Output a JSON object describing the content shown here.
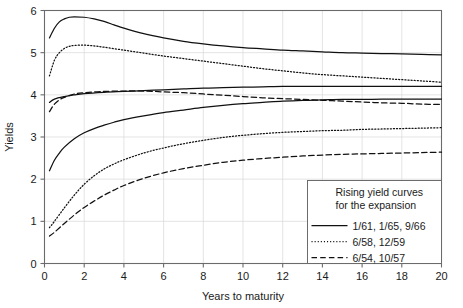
{
  "chart_data": {
    "type": "line",
    "title": "",
    "xlabel": "Years to maturity",
    "ylabel": "Yields",
    "xlim": [
      0,
      20
    ],
    "ylim": [
      0,
      6
    ],
    "xticks": [
      "0",
      "2",
      "4",
      "6",
      "8",
      "10",
      "12",
      "14",
      "16",
      "18",
      "20"
    ],
    "yticks": [
      "0",
      "1",
      "2",
      "3",
      "4",
      "5",
      "6"
    ],
    "grid": true,
    "legend_position": "bottom-right",
    "legend_title": [
      "Rising yield curves",
      "for the expansion"
    ],
    "series": [
      {
        "name": "1/61, 1/65, 9/66",
        "style": "solid",
        "band": "upper",
        "x": [
          0.25,
          0.5,
          0.75,
          1.0,
          1.25,
          1.5,
          2.0,
          2.5,
          3.0,
          3.5,
          4.0,
          5.0,
          6.0,
          7.0,
          8.0,
          9.0,
          10.0,
          11.0,
          12.0,
          13.0,
          14.0,
          15.0,
          16.0,
          17.0,
          18.0,
          19.0,
          20.0
        ],
        "y": [
          5.35,
          5.58,
          5.73,
          5.8,
          5.84,
          5.85,
          5.84,
          5.8,
          5.74,
          5.66,
          5.58,
          5.45,
          5.35,
          5.27,
          5.21,
          5.16,
          5.12,
          5.09,
          5.06,
          5.04,
          5.02,
          5.0,
          4.99,
          4.98,
          4.97,
          4.96,
          4.95
        ]
      },
      {
        "name": "1/61, 1/65, 9/66",
        "style": "solid",
        "band": "middle-upper",
        "x": [
          0.25,
          0.5,
          1.0,
          1.5,
          2.0,
          3.0,
          4.0,
          5.0,
          6.0,
          7.0,
          8.0,
          9.0,
          10.0,
          11.0,
          12.0,
          13.0,
          14.0,
          15.0,
          16.0,
          17.0,
          18.0,
          19.0,
          20.0
        ],
        "y": [
          3.82,
          3.9,
          3.96,
          4.0,
          4.03,
          4.06,
          4.08,
          4.1,
          4.12,
          4.14,
          4.16,
          4.17,
          4.18,
          4.19,
          4.2,
          4.2,
          4.2,
          4.2,
          4.2,
          4.2,
          4.2,
          4.2,
          4.2
        ]
      },
      {
        "name": "1/61, 1/65, 9/66",
        "style": "solid",
        "band": "lower",
        "x": [
          0.25,
          0.5,
          0.75,
          1.0,
          1.5,
          2.0,
          2.5,
          3.0,
          3.5,
          4.0,
          5.0,
          6.0,
          7.0,
          8.0,
          9.0,
          10.0,
          11.0,
          12.0,
          13.0,
          14.0,
          15.0,
          16.0,
          17.0,
          18.0,
          19.0,
          20.0
        ],
        "y": [
          2.2,
          2.45,
          2.62,
          2.76,
          2.96,
          3.1,
          3.2,
          3.28,
          3.35,
          3.41,
          3.5,
          3.58,
          3.64,
          3.7,
          3.75,
          3.79,
          3.82,
          3.85,
          3.87,
          3.88,
          3.89,
          3.89,
          3.9,
          3.9,
          3.9,
          3.9
        ]
      },
      {
        "name": "6/58, 12/59",
        "style": "dotted",
        "band": "upper",
        "x": [
          0.25,
          0.5,
          0.75,
          1.0,
          1.25,
          1.5,
          2.0,
          2.5,
          3.0,
          4.0,
          5.0,
          6.0,
          7.0,
          8.0,
          9.0,
          10.0,
          11.0,
          12.0,
          13.0,
          14.0,
          15.0,
          16.0,
          17.0,
          18.0,
          19.0,
          20.0
        ],
        "y": [
          4.45,
          4.82,
          5.0,
          5.1,
          5.15,
          5.17,
          5.18,
          5.16,
          5.13,
          5.06,
          4.99,
          4.92,
          4.86,
          4.8,
          4.74,
          4.68,
          4.62,
          4.57,
          4.52,
          4.48,
          4.45,
          4.42,
          4.39,
          4.36,
          4.33,
          4.3
        ]
      },
      {
        "name": "6/58, 12/59",
        "style": "dotted",
        "band": "lower",
        "x": [
          0.25,
          0.5,
          1.0,
          1.5,
          2.0,
          2.5,
          3.0,
          3.5,
          4.0,
          5.0,
          6.0,
          7.0,
          8.0,
          9.0,
          10.0,
          11.0,
          12.0,
          13.0,
          14.0,
          15.0,
          16.0,
          17.0,
          18.0,
          19.0,
          20.0
        ],
        "y": [
          0.85,
          1.0,
          1.32,
          1.62,
          1.88,
          2.08,
          2.24,
          2.36,
          2.46,
          2.62,
          2.74,
          2.84,
          2.92,
          2.99,
          3.04,
          3.08,
          3.11,
          3.13,
          3.15,
          3.16,
          3.18,
          3.19,
          3.2,
          3.21,
          3.22
        ]
      },
      {
        "name": "6/54, 10/57",
        "style": "dashed",
        "band": "upper",
        "x": [
          0.25,
          0.5,
          0.75,
          1.0,
          1.5,
          2.0,
          3.0,
          4.0,
          5.0,
          6.0,
          7.0,
          8.0,
          9.0,
          10.0,
          11.0,
          12.0,
          13.0,
          14.0,
          15.0,
          16.0,
          17.0,
          18.0,
          19.0,
          20.0
        ],
        "y": [
          3.6,
          3.78,
          3.88,
          3.94,
          4.02,
          4.05,
          4.08,
          4.09,
          4.09,
          4.07,
          4.05,
          4.02,
          3.99,
          3.96,
          3.93,
          3.91,
          3.89,
          3.87,
          3.85,
          3.83,
          3.81,
          3.8,
          3.78,
          3.77
        ]
      },
      {
        "name": "6/54, 10/57",
        "style": "dashed",
        "band": "lower",
        "x": [
          0.25,
          0.5,
          1.0,
          1.5,
          2.0,
          2.5,
          3.0,
          3.5,
          4.0,
          5.0,
          6.0,
          7.0,
          8.0,
          9.0,
          10.0,
          11.0,
          12.0,
          13.0,
          14.0,
          15.0,
          16.0,
          17.0,
          18.0,
          19.0,
          20.0
        ],
        "y": [
          0.65,
          0.74,
          0.95,
          1.15,
          1.33,
          1.48,
          1.62,
          1.74,
          1.85,
          2.02,
          2.15,
          2.25,
          2.33,
          2.4,
          2.45,
          2.49,
          2.52,
          2.55,
          2.57,
          2.59,
          2.6,
          2.61,
          2.62,
          2.63,
          2.64
        ]
      }
    ],
    "legend_entries": [
      {
        "label": "1/61, 1/65, 9/66",
        "style": "solid"
      },
      {
        "label": "6/58, 12/59",
        "style": "dotted"
      },
      {
        "label": "6/54, 10/57",
        "style": "dashed"
      }
    ]
  }
}
